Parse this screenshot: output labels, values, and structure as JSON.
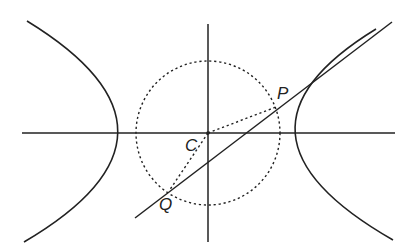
{
  "diagram": {
    "type": "hyperbola-with-director-circle",
    "colors": {
      "stroke": "#222222",
      "background": "#ffffff"
    },
    "axes": {
      "horizontal": {
        "x1": 22,
        "y1": 133,
        "x2": 395,
        "y2": 133
      },
      "vertical": {
        "x1": 208,
        "y1": 24,
        "x2": 208,
        "y2": 242
      }
    },
    "circle": {
      "cx": 208,
      "cy": 133,
      "r": 72,
      "style": "dotted"
    },
    "hyperbola": {
      "left_branch": "M27,21 Q210,133 24,242",
      "right_branch": "M376,29 Q206,133 393,240"
    },
    "tangent_line": {
      "x1": 135,
      "y1": 218,
      "x2": 392,
      "y2": 22
    },
    "radius_lines": [
      {
        "x1": 208,
        "y1": 133,
        "x2": 276,
        "y2": 107
      },
      {
        "x1": 208,
        "y1": 133,
        "x2": 169,
        "y2": 191
      }
    ],
    "points": {
      "C": {
        "x": 208,
        "y": 133,
        "label": "C",
        "label_x": 185,
        "label_y": 151
      },
      "P": {
        "x": 276,
        "y": 107,
        "label": "P",
        "label_x": 277,
        "label_y": 99
      },
      "Q": {
        "x": 169,
        "y": 191,
        "label": "Q",
        "label_x": 159,
        "label_y": 210
      }
    }
  }
}
